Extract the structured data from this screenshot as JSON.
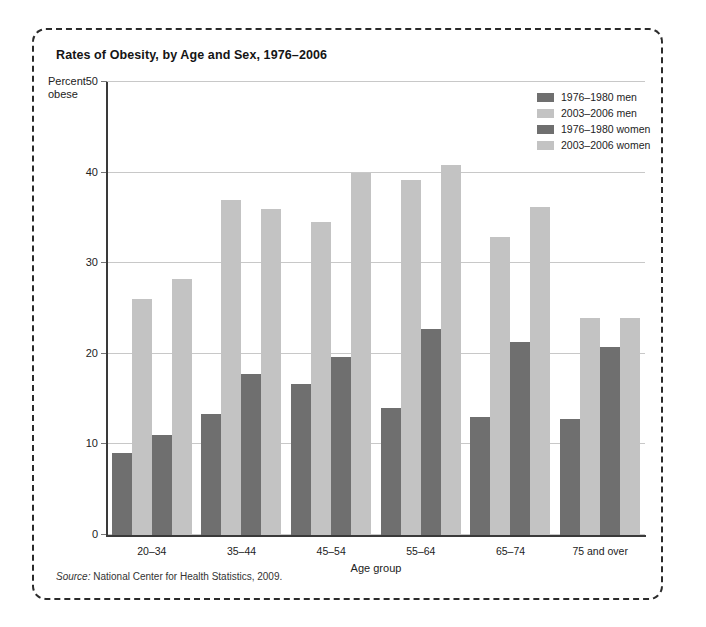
{
  "chart_data": {
    "type": "bar",
    "title": "Rates of Obesity, by Age and Sex, 1976–2006",
    "xlabel": "Age group",
    "ylabel": "Percent obese",
    "ylabel_line1": "Percent",
    "ylabel_line2": "obese",
    "ylim": [
      0,
      50
    ],
    "yticks": [
      0,
      10,
      20,
      30,
      40,
      50
    ],
    "ytick_labels": [
      "0",
      "10",
      "20",
      "30",
      "40",
      "50"
    ],
    "grid": true,
    "legend_position": "top-right",
    "categories": [
      "20–34",
      "35–44",
      "45–54",
      "55–64",
      "65–74",
      "75 and over"
    ],
    "series": [
      {
        "name": "1976–1980 men",
        "color": "#6f6f6f",
        "values": [
          9.0,
          13.4,
          16.7,
          14.0,
          13.0,
          12.8
        ]
      },
      {
        "name": "2003–2006 men",
        "color": "#c3c3c3",
        "values": [
          26.1,
          37.0,
          34.5,
          39.2,
          32.9,
          23.9
        ]
      },
      {
        "name": "1976–1980 women",
        "color": "#6f6f6f",
        "values": [
          11.0,
          17.8,
          19.6,
          22.7,
          21.3,
          20.8
        ]
      },
      {
        "name": "2003–2006 women",
        "color": "#c3c3c3",
        "values": [
          28.3,
          36.0,
          40.0,
          40.8,
          36.2,
          24.0
        ]
      }
    ],
    "source_prefix": "Source:",
    "source_text": "National Center for Health Statistics, 2009."
  }
}
